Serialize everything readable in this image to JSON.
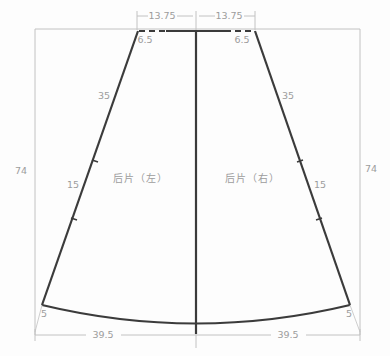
{
  "diagram": {
    "type": "sewing-pattern-draft",
    "pieces": {
      "left": {
        "label": "后片（左）"
      },
      "right": {
        "label": "后片（右）"
      }
    },
    "dims": {
      "top_width_left": "13.75",
      "top_width_right": "13.75",
      "top_notch_left": "6.5",
      "top_notch_right": "6.5",
      "side_upper_left": "35",
      "side_upper_right": "35",
      "side_lower_left": "15",
      "side_lower_right": "15",
      "height_left": "74",
      "height_right": "74",
      "hem_rise_left": "5",
      "hem_rise_right": "5",
      "hem_width_left": "39.5",
      "hem_width_right": "39.5"
    },
    "colors": {
      "outline": "#3b3b3b",
      "dimension": "#c2c2c2",
      "text": "#9c9c9c",
      "background": "#fdfdfd"
    }
  }
}
